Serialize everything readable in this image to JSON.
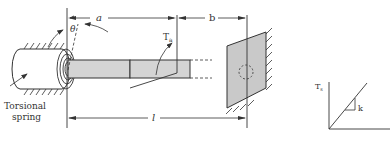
{
  "labels": {
    "a": "a",
    "b": "b",
    "l": "l",
    "theta": "θ",
    "torque_applied": "T",
    "torque_applied_sub": "a",
    "spring_line1": "Torsional",
    "spring_line2": "spring",
    "graph_y": "T",
    "graph_y_sub": "s",
    "graph_slope": "k"
  },
  "colors": {
    "shaft_fill": "#d4d4d4",
    "wall_fill": "#c9c9c9",
    "line": "#333333"
  }
}
